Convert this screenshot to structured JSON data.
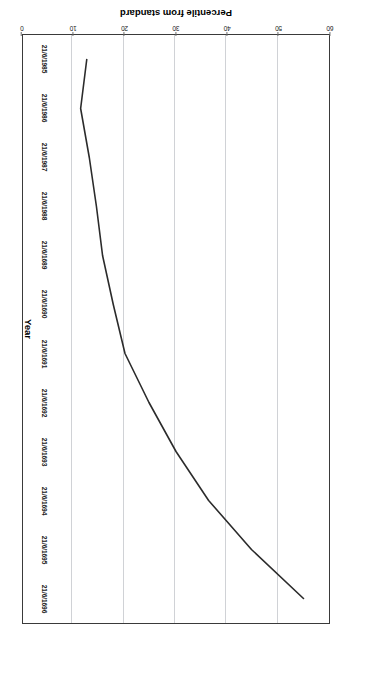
{
  "chart_data": {
    "type": "line",
    "title": "",
    "xlabel": "Year",
    "ylabel": "Percentile from standard",
    "grid": "value-axis gridlines only",
    "legend": "none",
    "orientation": "figure printed rotated 180 degrees; value axis runs right-to-left along the bottom",
    "xlim": [
      "21/6/1985",
      "21/6/1996"
    ],
    "ylim": [
      0,
      60
    ],
    "ytick_step": 10,
    "categories": [
      "21/6/1985",
      "21/6/1986",
      "21/6/1987",
      "21/6/1988",
      "21/6/1989",
      "21/6/1690",
      "21/6/1691",
      "21/6/1692",
      "21/6/1693",
      "21/6/1694",
      "21/6/1695",
      "21/6/1696"
    ],
    "category_labels": [
      "21/6/1985",
      "21/6/1986",
      "21/6/1987",
      "21/6/1988",
      "21/6/1689",
      "21/6/1690",
      "21/6/1691",
      "21/6/1692",
      "21/6/1693",
      "21/6/1694",
      "21/6/1695",
      "21/6/1696"
    ],
    "ytick_labels": [
      "0",
      "10",
      "20",
      "30",
      "40",
      "50",
      "60"
    ],
    "ytick_values": [
      0,
      10,
      20,
      30,
      40,
      50,
      60
    ],
    "values": [
      12.5,
      11.3,
      13.0,
      14.4,
      15.6,
      17.7,
      20.0,
      24.7,
      30.0,
      36.4,
      44.8,
      55.0
    ],
    "series": [
      {
        "name": "Percentile from standard",
        "color": "#2b2b2b",
        "values": [
          12.5,
          11.3,
          13.0,
          14.4,
          15.6,
          17.7,
          20.0,
          24.7,
          30.0,
          36.4,
          44.8,
          55.0
        ]
      }
    ]
  },
  "axis": {
    "value_axis_title": "Percentile from standard",
    "category_axis_title": "Year"
  },
  "colors": {
    "line": "#2b2b2b",
    "grid": "#d0d2d6",
    "frame": "#3a3a3a",
    "background": "#ffffff",
    "text": "#1a1a1a"
  }
}
